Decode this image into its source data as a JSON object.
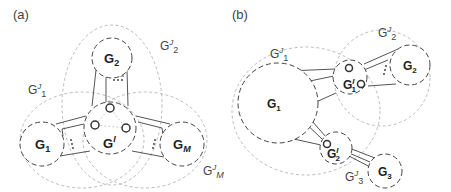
{
  "panels": [
    {
      "label": "(a)",
      "nodes": {
        "g1": {
          "main": "G",
          "sub": "1"
        },
        "g2": {
          "main": "G",
          "sub": "2"
        },
        "gm": {
          "main": "G",
          "sub": "M"
        },
        "gi": {
          "main": "G",
          "sup": "I"
        }
      },
      "groups": {
        "gj1": {
          "main": "G",
          "sup": "J",
          "sub": "1"
        },
        "gj2": {
          "main": "G",
          "sup": "J",
          "sub": "2"
        },
        "gjm": {
          "main": "G",
          "sup": "J",
          "sub": "M"
        }
      }
    },
    {
      "label": "(b)",
      "nodes": {
        "g1": {
          "main": "G",
          "sub": "1"
        },
        "g2": {
          "main": "G",
          "sub": "2"
        },
        "g3": {
          "main": "G",
          "sub": "3"
        },
        "gi1": {
          "main": "G",
          "sup": "I",
          "sub": "1"
        },
        "gi2": {
          "main": "G",
          "sup": "I",
          "sub": "2"
        }
      },
      "groups": {
        "gj1": {
          "main": "G",
          "sup": "J",
          "sub": "1"
        },
        "gj2": {
          "main": "G",
          "sup": "J",
          "sub": "2"
        },
        "gj3": {
          "main": "G",
          "sup": "J",
          "sub": "3"
        }
      }
    }
  ],
  "colors": {
    "node_stroke": "#444444",
    "group_stroke": "#bbbbbb",
    "text": "#222222"
  }
}
